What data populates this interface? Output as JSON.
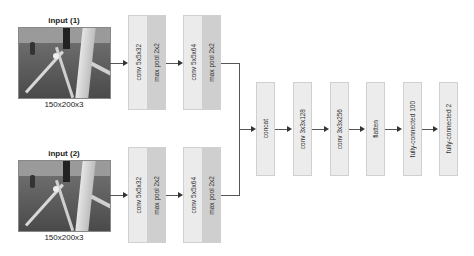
{
  "inputs": [
    {
      "title": "input (1)",
      "shape": "150x200x3"
    },
    {
      "title": "input (2)",
      "shape": "150x200x3"
    }
  ],
  "branch_top": {
    "blocks": [
      {
        "conv": "conv 5x5x32",
        "pool": "max pool 2x2"
      },
      {
        "conv": "conv 5x5x64",
        "pool": "max pool 2x2"
      }
    ]
  },
  "branch_bottom": {
    "blocks": [
      {
        "conv": "conv 5x5x32",
        "pool": "max pool 2x2"
      },
      {
        "conv": "conv 5x5x64",
        "pool": "max pool 2x2"
      }
    ]
  },
  "merged": {
    "layers": [
      "concat",
      "conv 3x3x128",
      "conv 3x3x256",
      "flatten",
      "fully-connected 100",
      "fully-connected 2"
    ]
  },
  "colors": {
    "block_light": "#ebebeb",
    "block_dark": "#cfcfcf",
    "line": "#555555"
  }
}
